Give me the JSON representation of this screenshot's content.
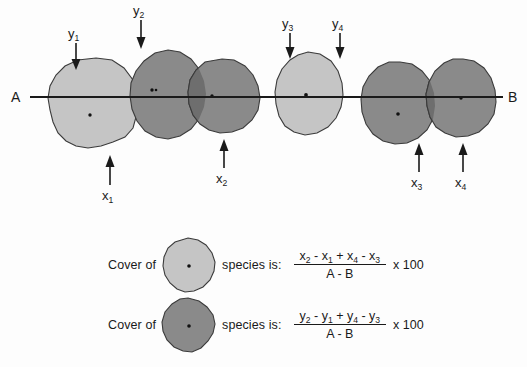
{
  "diagram": {
    "transect": {
      "start_label": "A",
      "end_label": "B"
    },
    "top_arrows": [
      {
        "id": "y1",
        "label": "y",
        "sub": "1",
        "direction": "down"
      },
      {
        "id": "y2",
        "label": "y",
        "sub": "2",
        "direction": "down"
      },
      {
        "id": "y3",
        "label": "y",
        "sub": "3",
        "direction": "down"
      },
      {
        "id": "y4",
        "label": "y",
        "sub": "4",
        "direction": "down"
      }
    ],
    "bottom_arrows": [
      {
        "id": "x1",
        "label": "x",
        "sub": "1",
        "direction": "up"
      },
      {
        "id": "x2",
        "label": "x",
        "sub": "2",
        "direction": "up"
      },
      {
        "id": "x3",
        "label": "x",
        "sub": "3",
        "direction": "up"
      },
      {
        "id": "x4",
        "label": "x",
        "sub": "4",
        "direction": "up"
      }
    ],
    "colors": {
      "light_species": "#c5c5c5",
      "dark_species": "#8a8a8a",
      "overlap": "#6e6e6e",
      "outline": "#3b3b3b",
      "line": "#1a1a1a",
      "background": "#fdfdfd"
    },
    "canopies": [
      {
        "id": "blob-light-1",
        "species": "light",
        "center_dot": true
      },
      {
        "id": "blob-dark-1",
        "species": "dark",
        "center_dot": true
      },
      {
        "id": "blob-dark-2",
        "species": "dark",
        "center_dot": true
      },
      {
        "id": "blob-light-2",
        "species": "light",
        "center_dot": true
      },
      {
        "id": "blob-dark-3",
        "species": "dark",
        "center_dot": true
      },
      {
        "id": "blob-dark-4",
        "species": "dark",
        "center_dot": true
      }
    ]
  },
  "legend": {
    "rows": [
      {
        "id": "light-species-row",
        "prefix": "Cover of",
        "swatch_species": "light",
        "suffix": "species is:",
        "numerator_parts": [
          {
            "base": "x",
            "sub": "2",
            "op_after": "-"
          },
          {
            "base": "x",
            "sub": "1",
            "op_after": "+"
          },
          {
            "base": "x",
            "sub": "4",
            "op_after": "-"
          },
          {
            "base": "x",
            "sub": "3",
            "op_after": ""
          }
        ],
        "denominator": "A - B",
        "multiplier": "x 100"
      },
      {
        "id": "dark-species-row",
        "prefix": "Cover of",
        "swatch_species": "dark",
        "suffix": "species is:",
        "numerator_parts": [
          {
            "base": "y",
            "sub": "2",
            "op_after": "-"
          },
          {
            "base": "y",
            "sub": "1",
            "op_after": "+"
          },
          {
            "base": "y",
            "sub": "4",
            "op_after": "-"
          },
          {
            "base": "y",
            "sub": "3",
            "op_after": ""
          }
        ],
        "denominator": "A - B",
        "multiplier": "x 100"
      }
    ]
  }
}
